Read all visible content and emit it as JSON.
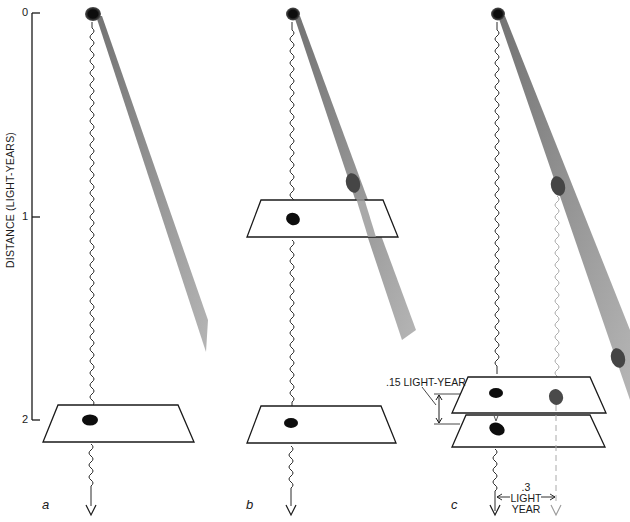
{
  "figure": {
    "type": "scientific-illustration",
    "axis": {
      "title": "DISTANCE (LIGHT-YEARS)",
      "ticks": [
        {
          "label": "0",
          "value": 0
        },
        {
          "label": "1",
          "value": 1
        },
        {
          "label": "2",
          "value": 2
        }
      ]
    },
    "panels": [
      {
        "id": "a",
        "label": "a",
        "planes": 1,
        "description": "Single detection plane at 2 light-years; star emits wavy light ray straight down and a gray shaft diagonally"
      },
      {
        "id": "b",
        "label": "b",
        "planes": 2,
        "description": "Detection planes at ~1 and 2 light-years; blob along diagonal shaft crossing first plane"
      },
      {
        "id": "c",
        "label": "c",
        "planes": 2,
        "description": "Two closely stacked planes near 2 light-years; secondary ray offset by .3 light-year"
      }
    ],
    "annotations": {
      "plane_separation": ".15 LIGHT-YEAR",
      "offset_value": ".3",
      "offset_unit_1": "LIGHT",
      "offset_unit_2": "YEAR"
    },
    "colors": {
      "ink": "#1a1a1a",
      "shaft": "#8c8c8c",
      "blob_dark": "#111111",
      "blob_gray": "#4a4a4a",
      "faint_ray": "#b0b0b0"
    }
  }
}
